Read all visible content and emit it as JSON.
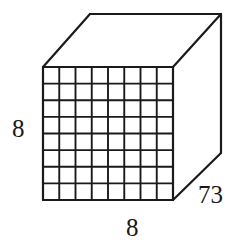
{
  "figure": {
    "kind": "rectangular-prism-with-grid",
    "background_color": "#ffffff",
    "stroke_color": "#1a1a1a",
    "text_color": "#1a1a1a",
    "grid": {
      "columns": 8,
      "rows": 8,
      "cell_count": 64
    },
    "geometry": {
      "front_face": {
        "left": 43,
        "top": 67,
        "right": 173,
        "bottom": 200
      },
      "depth_offset": {
        "dx": 48,
        "dy": -53
      },
      "vertices": {
        "front_top_left": [
          43,
          67
        ],
        "front_top_right": [
          173,
          67
        ],
        "front_bottom_left": [
          43,
          200
        ],
        "front_bottom_right": [
          173,
          200
        ],
        "back_top_left": [
          90,
          14
        ],
        "back_top_right": [
          221,
          14
        ],
        "back_bottom_right": [
          221,
          153
        ]
      }
    },
    "stroke_widths": {
      "outline": 2.2,
      "grid": 1.9
    }
  },
  "labels": {
    "height": "8",
    "width": "8",
    "depth": "73"
  }
}
